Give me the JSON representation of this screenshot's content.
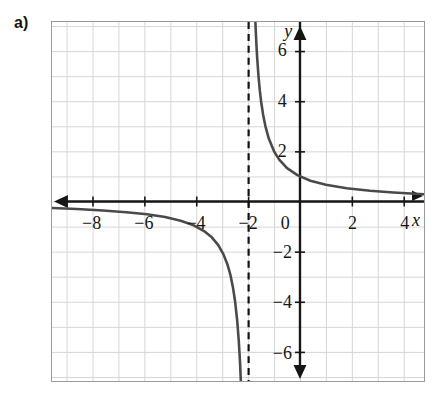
{
  "figure": {
    "part_label": "a)",
    "axis_names": {
      "x": "x",
      "y": "y"
    },
    "colors": {
      "grid": "#d6d6d6",
      "frame": "#9a9a9a",
      "axis": "#161616",
      "curve": "#4a4a4a",
      "asymptote": "#111111",
      "background": "#ffffff"
    }
  },
  "chart_data": {
    "type": "line",
    "title": "",
    "xlabel": "x",
    "ylabel": "y",
    "grid": true,
    "legend": null,
    "xlim": [
      -9.56,
      4.78
    ],
    "ylim": [
      -7.16,
      7.16
    ],
    "xticks": [
      -8,
      -6,
      -4,
      -2,
      0,
      2,
      4
    ],
    "xtick_labels": [
      "−8",
      "−6",
      "−4",
      "−2",
      "0",
      "2",
      "4"
    ],
    "yticks": [
      -6,
      -4,
      -2,
      2,
      4,
      6
    ],
    "ytick_labels": [
      "−6",
      "−4",
      "−2",
      "2",
      "4",
      "6"
    ],
    "grid_step": 1,
    "equation": "y = 2/(x + 2)",
    "asymptotes": [
      {
        "kind": "vertical",
        "value": -2,
        "style": "dashed"
      },
      {
        "kind": "horizontal",
        "value": 0,
        "style": "solid-axis"
      }
    ],
    "series": [
      {
        "name": "right-branch",
        "comment": "x > -2, decreasing from +infinity toward y = 0",
        "points": [
          [
            -1.72,
            7.16
          ],
          [
            -1.7,
            6.7
          ],
          [
            -1.68,
            6.25
          ],
          [
            -1.65,
            5.72
          ],
          [
            -1.6,
            5.0
          ],
          [
            -1.55,
            4.44
          ],
          [
            -1.5,
            4.0
          ],
          [
            -1.42,
            3.45
          ],
          [
            -1.33,
            2.99
          ],
          [
            -1.2,
            2.5
          ],
          [
            -1.0,
            2.0
          ],
          [
            -0.8,
            1.67
          ],
          [
            -0.5,
            1.33
          ],
          [
            -0.1,
            1.05
          ],
          [
            0.4,
            0.83
          ],
          [
            1.0,
            0.67
          ],
          [
            1.8,
            0.53
          ],
          [
            2.7,
            0.43
          ],
          [
            3.6,
            0.36
          ],
          [
            4.78,
            0.29
          ]
        ]
      },
      {
        "name": "left-branch",
        "comment": "x < -2, decreasing from y = 0 toward -infinity",
        "points": [
          [
            -9.56,
            -0.26
          ],
          [
            -8.6,
            -0.3
          ],
          [
            -7.6,
            -0.36
          ],
          [
            -6.7,
            -0.43
          ],
          [
            -5.9,
            -0.51
          ],
          [
            -5.2,
            -0.62
          ],
          [
            -4.6,
            -0.77
          ],
          [
            -4.1,
            -0.95
          ],
          [
            -3.7,
            -1.18
          ],
          [
            -3.4,
            -1.43
          ],
          [
            -3.15,
            -1.74
          ],
          [
            -2.95,
            -2.11
          ],
          [
            -2.8,
            -2.5
          ],
          [
            -2.68,
            -2.94
          ],
          [
            -2.58,
            -3.45
          ],
          [
            -2.5,
            -4.0
          ],
          [
            -2.42,
            -4.76
          ],
          [
            -2.36,
            -5.56
          ],
          [
            -2.31,
            -6.45
          ],
          [
            -2.28,
            -7.16
          ]
        ]
      }
    ]
  }
}
